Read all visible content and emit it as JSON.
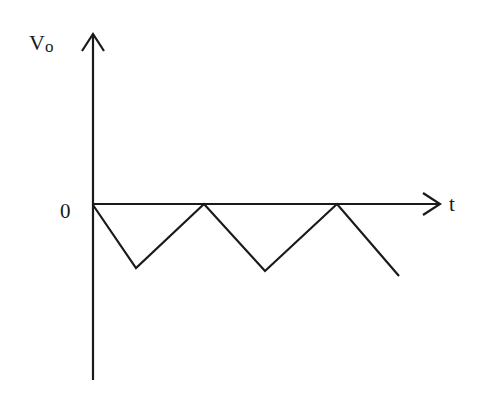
{
  "diagram": {
    "type": "waveform",
    "axes": {
      "y_label_main": "V",
      "y_label_sub": "o",
      "x_label": "t",
      "origin_label": "0"
    },
    "colors": {
      "line": "#1a1a1a",
      "background": "#ffffff"
    },
    "waveform_points": "93,205 136,268 204,204 265,271 337,204 399,276"
  }
}
